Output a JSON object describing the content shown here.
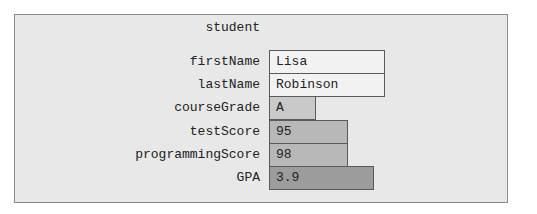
{
  "object": {
    "name": "student",
    "fields": [
      {
        "label": "firstName",
        "value": "Lisa"
      },
      {
        "label": "lastName",
        "value": "Robinson"
      },
      {
        "label": "courseGrade",
        "value": "A"
      },
      {
        "label": "testScore",
        "value": "95"
      },
      {
        "label": "programmingScore",
        "value": "98"
      },
      {
        "label": "GPA",
        "value": "3.9"
      }
    ]
  },
  "colors": {
    "panel_bg": "#e8e8e8",
    "string_box": "#f2f2f2",
    "char_box": "#c9c9c9",
    "int_box": "#b8b8b8",
    "double_box": "#9c9c9c"
  }
}
